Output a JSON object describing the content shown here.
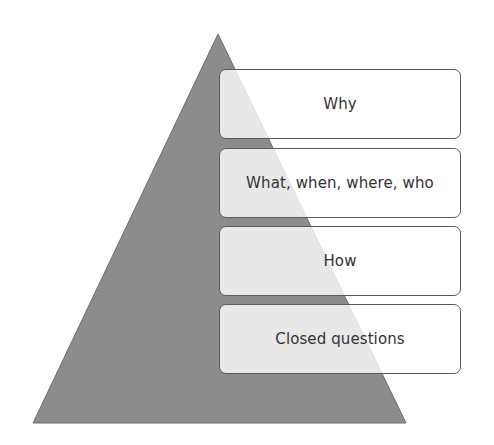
{
  "diagram": {
    "type": "pyramid",
    "colors": {
      "pyramid_fill": "#8c8c8c",
      "pyramid_stroke": "#6e6e6e",
      "box_border": "#5a5a5a",
      "box_fill": "rgba(255,255,255,0.80)",
      "text": "#333333"
    },
    "levels": [
      {
        "label": "Why"
      },
      {
        "label": "What, when, where, who"
      },
      {
        "label": "How"
      },
      {
        "label": "Closed questions"
      }
    ]
  }
}
